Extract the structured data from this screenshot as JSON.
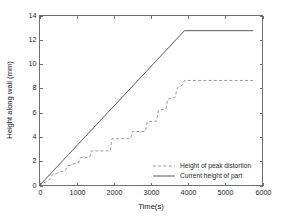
{
  "chart_data": {
    "type": "line",
    "title": "",
    "xlabel": "Time(s)",
    "ylabel": "Height along wall (mm)",
    "xlim": [
      0,
      6000
    ],
    "ylim": [
      0,
      14
    ],
    "xticks": [
      0,
      1000,
      2000,
      3000,
      4000,
      5000,
      6000
    ],
    "yticks": [
      0,
      2,
      4,
      6,
      8,
      10,
      12,
      14
    ],
    "xtick_labels": [
      "0",
      "1000",
      "2000",
      "3000",
      "4000",
      "5000",
      "6000"
    ],
    "ytick_labels": [
      "0",
      "2",
      "4",
      "6",
      "8",
      "10",
      "12",
      "14"
    ],
    "grid": false,
    "legend_position": "lower right",
    "series": [
      {
        "name": "Height of peak distortion",
        "style": "dashed",
        "color": "#9a9a9a",
        "x": [
          0,
          300,
          350,
          700,
          750,
          1050,
          1100,
          1350,
          1400,
          1900,
          1950,
          2450,
          2500,
          2850,
          2900,
          3150,
          3200,
          3400,
          3450,
          3650,
          3700,
          3850,
          3900,
          5750
        ],
        "y": [
          0.0,
          0.55,
          0.9,
          1.25,
          1.6,
          1.9,
          2.3,
          2.3,
          2.85,
          2.85,
          3.85,
          3.85,
          4.45,
          4.45,
          5.25,
          5.3,
          6.2,
          6.3,
          7.1,
          7.25,
          8.0,
          8.3,
          8.65,
          8.65
        ]
      },
      {
        "name": "Current height of part",
        "style": "solid",
        "color": "#5a5a5a",
        "x": [
          0,
          3900,
          5750
        ],
        "y": [
          0.0,
          12.75,
          12.75
        ]
      }
    ],
    "annotations": []
  },
  "legend": {
    "entries": [
      {
        "label": "Height of peak distortion",
        "style": "dashed"
      },
      {
        "label": "Current height of part",
        "style": "solid"
      }
    ]
  }
}
